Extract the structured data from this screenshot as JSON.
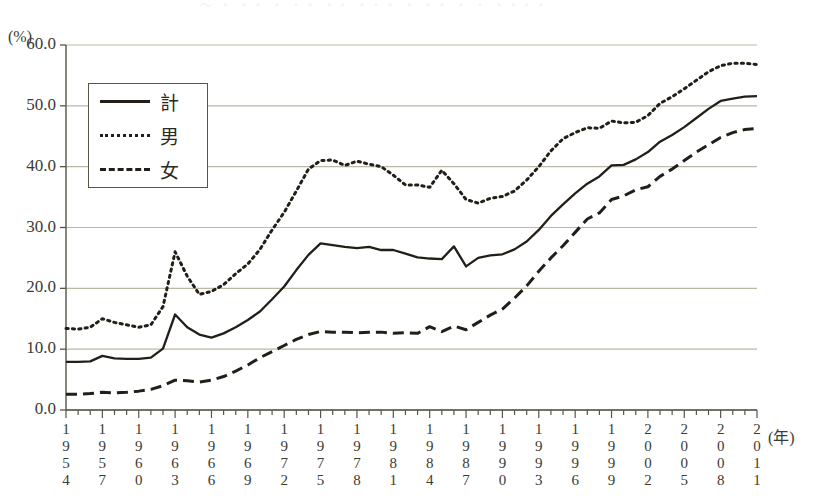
{
  "figure": {
    "title_remnant": "～ ・ ・・ ・ ・・  ・・ ・・・  ・ ・・ ・ ・ ・・・・",
    "unit_label": "(%)",
    "x_unit_label": "(年)"
  },
  "legend": {
    "position": "inside-top-left",
    "items": [
      {
        "label": "計",
        "style": "solid"
      },
      {
        "label": "男",
        "style": "dotted"
      },
      {
        "label": "女",
        "style": "dashed"
      }
    ]
  },
  "axes": {
    "y_ticks": [
      "0.0",
      "10.0",
      "20.0",
      "30.0",
      "40.0",
      "50.0",
      "60.0"
    ],
    "x_tick_labels": [
      "1954",
      "1957",
      "1960",
      "1963",
      "1966",
      "1969",
      "1972",
      "1975",
      "1978",
      "1981",
      "1984",
      "1987",
      "1990",
      "1993",
      "1996",
      "1999",
      "2002",
      "2005",
      "2008",
      "2011"
    ]
  },
  "colors": {
    "line": "#231f18",
    "grid": "#b9b9a6",
    "axis": "#55554a",
    "text": "#3b3b33",
    "background": "#ffffff"
  },
  "chart_data": {
    "type": "line",
    "title": "",
    "xlabel": "年",
    "ylabel": "%",
    "xlim": [
      1954,
      2011
    ],
    "ylim": [
      0.0,
      60.0
    ],
    "ytick_step": 10.0,
    "grid": true,
    "legend_position": "upper left (inset box)",
    "x": [
      1954,
      1955,
      1956,
      1957,
      1958,
      1959,
      1960,
      1961,
      1962,
      1963,
      1964,
      1965,
      1966,
      1967,
      1968,
      1969,
      1970,
      1971,
      1972,
      1973,
      1974,
      1975,
      1976,
      1977,
      1978,
      1979,
      1980,
      1981,
      1982,
      1983,
      1984,
      1985,
      1986,
      1987,
      1988,
      1989,
      1990,
      1991,
      1992,
      1993,
      1994,
      1995,
      1996,
      1997,
      1998,
      1999,
      2000,
      2001,
      2002,
      2003,
      2004,
      2005,
      2006,
      2007,
      2008,
      2009,
      2010,
      2011
    ],
    "series": [
      {
        "name": "計",
        "style": "solid",
        "values": [
          7.9,
          7.9,
          8.0,
          8.9,
          8.5,
          8.4,
          8.4,
          8.6,
          10.1,
          15.7,
          13.6,
          12.4,
          11.9,
          12.6,
          13.6,
          14.8,
          16.2,
          18.2,
          20.3,
          23.0,
          25.5,
          27.4,
          27.1,
          26.8,
          26.6,
          26.8,
          26.3,
          26.3,
          25.7,
          25.1,
          24.9,
          24.8,
          26.9,
          23.6,
          25.0,
          25.4,
          25.6,
          26.4,
          27.7,
          29.6,
          31.9,
          33.8,
          35.6,
          37.2,
          38.4,
          40.2,
          40.3,
          41.2,
          42.4,
          44.1,
          45.2,
          46.5,
          48.0,
          49.5,
          50.8,
          51.2,
          51.5,
          51.6
        ]
      },
      {
        "name": "男",
        "style": "dotted",
        "values": [
          13.4,
          13.3,
          13.6,
          15.0,
          14.4,
          14.0,
          13.6,
          14.0,
          17.0,
          26.0,
          22.0,
          19.0,
          19.5,
          20.6,
          22.4,
          24.0,
          26.4,
          29.6,
          32.5,
          36.0,
          39.6,
          41.0,
          41.1,
          40.2,
          40.9,
          40.4,
          40.0,
          38.6,
          37.0,
          37.0,
          36.6,
          39.4,
          37.2,
          34.6,
          34.0,
          34.8,
          35.1,
          36.0,
          37.8,
          40.0,
          42.6,
          44.6,
          45.6,
          46.4,
          46.3,
          47.5,
          47.2,
          47.3,
          48.4,
          50.4,
          51.5,
          52.8,
          54.2,
          55.6,
          56.6,
          57.0,
          57.0,
          56.8
        ]
      },
      {
        "name": "女",
        "style": "dashed",
        "values": [
          2.6,
          2.6,
          2.7,
          2.9,
          2.8,
          2.9,
          3.1,
          3.4,
          4.0,
          4.9,
          4.8,
          4.6,
          4.9,
          5.5,
          6.4,
          7.4,
          8.6,
          9.6,
          10.6,
          11.6,
          12.4,
          12.9,
          12.8,
          12.8,
          12.7,
          12.8,
          12.8,
          12.6,
          12.7,
          12.6,
          13.7,
          12.9,
          13.8,
          13.2,
          14.4,
          15.6,
          16.6,
          18.4,
          20.4,
          22.8,
          25.0,
          27.0,
          29.2,
          31.4,
          32.4,
          34.6,
          35.2,
          36.2,
          36.7,
          38.4,
          39.6,
          41.0,
          42.4,
          43.6,
          44.8,
          45.6,
          46.1,
          46.3
        ]
      }
    ]
  }
}
